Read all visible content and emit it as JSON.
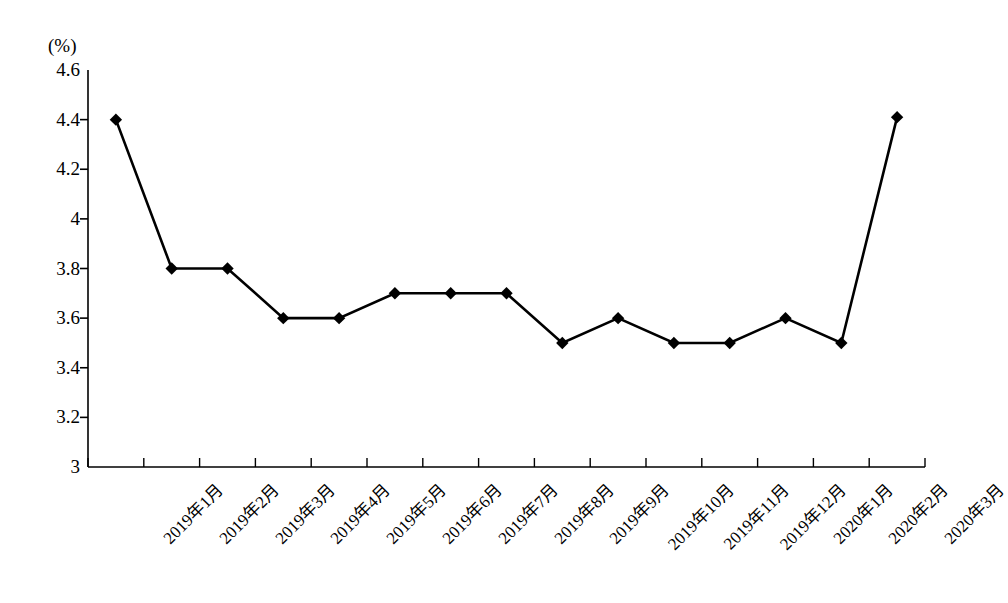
{
  "chart_data": {
    "type": "line",
    "title": "",
    "xlabel": "",
    "ylabel": "",
    "unit_label": "(%)",
    "categories": [
      "2019年1月",
      "2019年2月",
      "2019年3月",
      "2019年4月",
      "2019年5月",
      "2019年6月",
      "2019年7月",
      "2019年8月",
      "2019年9月",
      "2019年10月",
      "2019年11月",
      "2019年12月",
      "2020年1月",
      "2020年2月",
      "2020年3月"
    ],
    "values": [
      4.4,
      3.8,
      3.8,
      3.6,
      3.6,
      3.7,
      3.7,
      3.7,
      3.5,
      3.6,
      3.5,
      3.5,
      3.6,
      3.5,
      4.41
    ],
    "ylim": [
      3,
      4.6
    ],
    "ytick_values": [
      3,
      3.2,
      3.4,
      3.6,
      3.8,
      4,
      4.2,
      4.4,
      4.6
    ],
    "ytick_labels": [
      "3",
      "3.2",
      "3.4",
      "3.6",
      "3.8",
      "4",
      "4.2",
      "4.4",
      "4.6"
    ],
    "grid": false,
    "legend": false,
    "series_color": "#000000",
    "marker": "diamond",
    "x_label_rotation": -45
  }
}
